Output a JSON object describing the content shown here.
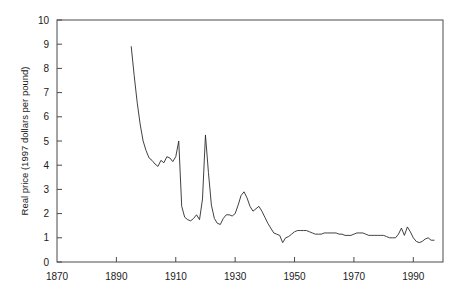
{
  "chart_data": {
    "type": "line",
    "title": "",
    "xlabel": "",
    "ylabel": "Real price (1997 dollars per pound)",
    "xlim": [
      1870,
      2000
    ],
    "ylim": [
      0,
      10
    ],
    "xticks": [
      1870,
      1890,
      1910,
      1930,
      1950,
      1970,
      1990
    ],
    "xtick_labels": [
      "1870",
      "1890",
      "1910",
      "1930",
      "1950",
      "1970",
      "1990"
    ],
    "yticks": [
      0,
      1,
      2,
      3,
      4,
      5,
      6,
      7,
      8,
      9,
      10
    ],
    "ytick_labels": [
      "0",
      "1",
      "2",
      "3",
      "4",
      "5",
      "6",
      "7",
      "8",
      "9",
      "10"
    ],
    "grid": false,
    "legend": null,
    "series": [
      {
        "name": "Real price",
        "x": [
          1895,
          1896,
          1897,
          1898,
          1899,
          1900,
          1901,
          1902,
          1903,
          1904,
          1905,
          1906,
          1907,
          1908,
          1909,
          1910,
          1911,
          1912,
          1913,
          1914,
          1915,
          1916,
          1917,
          1918,
          1919,
          1920,
          1921,
          1922,
          1923,
          1924,
          1925,
          1926,
          1927,
          1928,
          1929,
          1930,
          1931,
          1932,
          1933,
          1934,
          1935,
          1936,
          1937,
          1938,
          1939,
          1940,
          1941,
          1942,
          1943,
          1944,
          1945,
          1946,
          1947,
          1948,
          1949,
          1950,
          1951,
          1952,
          1953,
          1954,
          1955,
          1956,
          1957,
          1958,
          1959,
          1960,
          1961,
          1962,
          1963,
          1964,
          1965,
          1966,
          1967,
          1968,
          1969,
          1970,
          1971,
          1972,
          1973,
          1974,
          1975,
          1976,
          1977,
          1978,
          1979,
          1980,
          1981,
          1982,
          1983,
          1984,
          1985,
          1986,
          1987,
          1988,
          1989,
          1990,
          1991,
          1992,
          1993,
          1994,
          1995,
          1996,
          1997
        ],
        "y": [
          8.9,
          7.7,
          6.6,
          5.7,
          5.0,
          4.6,
          4.3,
          4.2,
          4.05,
          3.95,
          4.2,
          4.1,
          4.35,
          4.3,
          4.15,
          4.35,
          5.0,
          2.3,
          1.85,
          1.75,
          1.7,
          1.8,
          1.95,
          1.75,
          2.6,
          5.25,
          3.7,
          2.35,
          1.8,
          1.6,
          1.55,
          1.8,
          1.95,
          1.95,
          1.9,
          2.0,
          2.35,
          2.75,
          2.9,
          2.65,
          2.3,
          2.1,
          2.2,
          2.3,
          2.1,
          1.85,
          1.6,
          1.4,
          1.2,
          1.15,
          1.1,
          0.8,
          1.0,
          1.05,
          1.15,
          1.25,
          1.3,
          1.3,
          1.3,
          1.3,
          1.25,
          1.2,
          1.15,
          1.15,
          1.15,
          1.2,
          1.2,
          1.2,
          1.2,
          1.2,
          1.15,
          1.15,
          1.1,
          1.1,
          1.1,
          1.15,
          1.2,
          1.2,
          1.2,
          1.15,
          1.1,
          1.1,
          1.1,
          1.1,
          1.1,
          1.1,
          1.05,
          1.0,
          1.0,
          1.0,
          1.15,
          1.4,
          1.1,
          1.45,
          1.25,
          1.0,
          0.85,
          0.8,
          0.85,
          0.95,
          1.0,
          0.9,
          0.9
        ]
      }
    ],
    "annotations": []
  },
  "axes": {
    "ylabel": "Real price (1997 dollars per pound)"
  }
}
